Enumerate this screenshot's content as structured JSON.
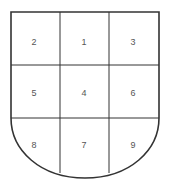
{
  "diagram": {
    "type": "heraldic-shield-grid",
    "cells": [
      {
        "label": "2",
        "row": 0,
        "col": 0
      },
      {
        "label": "1",
        "row": 0,
        "col": 1
      },
      {
        "label": "3",
        "row": 0,
        "col": 2
      },
      {
        "label": "5",
        "row": 1,
        "col": 0
      },
      {
        "label": "4",
        "row": 1,
        "col": 1
      },
      {
        "label": "6",
        "row": 1,
        "col": 2
      },
      {
        "label": "8",
        "row": 2,
        "col": 0
      },
      {
        "label": "7",
        "row": 2,
        "col": 1
      },
      {
        "label": "9",
        "row": 2,
        "col": 2
      }
    ],
    "stroke_color": "#333333",
    "label_color": "#555555"
  }
}
